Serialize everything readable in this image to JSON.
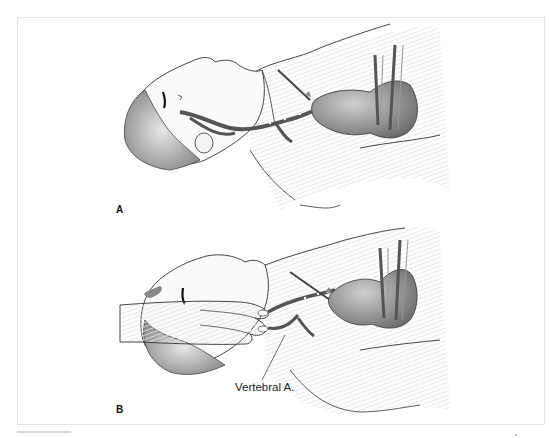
{
  "figure": {
    "panels": [
      {
        "id": "A",
        "label": "A",
        "description": "Patient supine, head turned, carotid/vertebral arteries from heart to head shown"
      },
      {
        "id": "B",
        "label": "B",
        "description": "Examiner's hand compressing neck over carotid, vertebral artery shown"
      }
    ],
    "callouts": [
      {
        "panel": "B",
        "text": "Vertebral A."
      }
    ],
    "colors": {
      "line": "#333333",
      "artery": "#5a5a5a",
      "shade": "#9a9a9a",
      "frame": "#e6e6e6"
    }
  }
}
